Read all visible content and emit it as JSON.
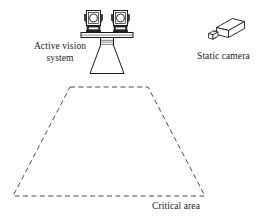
{
  "figure": {
    "background_color": "#ffffff",
    "stroke_color": "#1a1a1a",
    "dash_color": "#555555"
  },
  "labels": {
    "active_vision_line1": "Active vision",
    "active_vision_line2": "system",
    "active_vision_full": "Active vision system",
    "static_camera": "Static camera",
    "critical_area": "Critical area"
  },
  "elements": {
    "active_vision_system": {
      "name": "Active vision system",
      "left_camera_lens": "circle",
      "right_camera_lens": "circle",
      "mount_bar": "horizontal bar",
      "pedestal": "central neck",
      "field_of_view": "cone"
    },
    "static_camera": {
      "name": "Static camera",
      "body": "isometric box",
      "lens": "small cube"
    },
    "critical_area": {
      "name": "Critical area",
      "shape": "trapezoid",
      "line_style": "dashed",
      "top_left": [
        70,
        87
      ],
      "top_right": [
        148,
        87
      ],
      "bottom_right": [
        205,
        196
      ],
      "bottom_left": [
        13,
        196
      ]
    }
  }
}
